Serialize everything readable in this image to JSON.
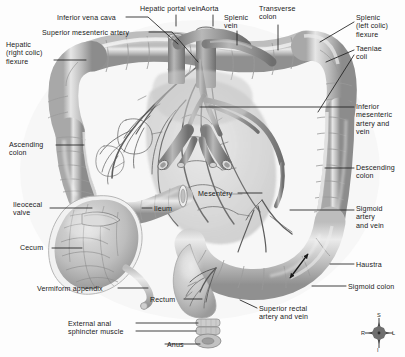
{
  "figure": {
    "background_color": "#fdfdfd",
    "tissue_color": "#d8d8d8",
    "vessel_color": "#8e8e8e",
    "leader_color": "#1f1f1f",
    "text_color": "#1a1a1a"
  },
  "labels": [
    {
      "id": "inferior-vena-cava",
      "text": "Inferior vena cava",
      "x": 57,
      "y": 14,
      "align": "l"
    },
    {
      "id": "hepatic-portal-vein",
      "text": "Hepatic portal vein",
      "x": 140,
      "y": 5,
      "align": "l"
    },
    {
      "id": "aorta",
      "text": "Aorta",
      "x": 201,
      "y": 5,
      "align": "l"
    },
    {
      "id": "splenic-vein",
      "text": "Splenic\nvein",
      "x": 224,
      "y": 14,
      "align": "l"
    },
    {
      "id": "transverse-colon",
      "text": "Transverse\ncolon",
      "x": 259,
      "y": 5,
      "align": "l"
    },
    {
      "id": "splenic-left-colic-flexure",
      "text": "Splenic\n(left colic)\nflexure",
      "x": 356,
      "y": 14,
      "align": "l"
    },
    {
      "id": "superior-mesenteric-artery",
      "text": "Superior mesenteric artery",
      "x": 42,
      "y": 29,
      "align": "l"
    },
    {
      "id": "hepatic-right-colic-flexure",
      "text": "Hepatic\n(right colic)\nflexure",
      "x": 6,
      "y": 41,
      "align": "l"
    },
    {
      "id": "taeniae-coli",
      "text": "Taeniae\ncoli",
      "x": 356,
      "y": 45,
      "align": "l"
    },
    {
      "id": "inferior-mesenteric-artery-and-vein",
      "text": "Inferior\nmesenteric\nartery and\nvein",
      "x": 356,
      "y": 103,
      "align": "l"
    },
    {
      "id": "ascending-colon",
      "text": "Ascending\ncolon",
      "x": 9,
      "y": 141,
      "align": "l"
    },
    {
      "id": "descending-colon",
      "text": "Descending\ncolon",
      "x": 356,
      "y": 164,
      "align": "l"
    },
    {
      "id": "mesentery",
      "text": "Mesentery",
      "x": 198,
      "y": 190,
      "align": "l"
    },
    {
      "id": "ileocecal-valve",
      "text": "Ileocecal\nvalve",
      "x": 13,
      "y": 201,
      "align": "l"
    },
    {
      "id": "ileum",
      "text": "Ileum",
      "x": 154,
      "y": 205,
      "align": "l"
    },
    {
      "id": "sigmoid-artery-and-vein",
      "text": "Sigmoid\nartery\nand vein",
      "x": 356,
      "y": 205,
      "align": "l"
    },
    {
      "id": "cecum",
      "text": "Cecum",
      "x": 20,
      "y": 244,
      "align": "l"
    },
    {
      "id": "haustra",
      "text": "Haustra",
      "x": 356,
      "y": 261,
      "align": "l"
    },
    {
      "id": "sigmoid-colon",
      "text": "Sigmoid colon",
      "x": 348,
      "y": 283,
      "align": "l"
    },
    {
      "id": "vermiform-appendix",
      "text": "Vermiform appendix",
      "x": 37,
      "y": 285,
      "align": "l"
    },
    {
      "id": "rectum",
      "text": "Rectum",
      "x": 150,
      "y": 296,
      "align": "l"
    },
    {
      "id": "superior-rectal-artery-and-vein",
      "text": "Superior rectal\nartery and vein",
      "x": 259,
      "y": 305,
      "align": "l"
    },
    {
      "id": "external-anal-sphincter-muscle",
      "text": "External anal\nsphincter muscle",
      "x": 68,
      "y": 320,
      "align": "l"
    },
    {
      "id": "anus",
      "text": "Anus",
      "x": 167,
      "y": 341,
      "align": "l"
    }
  ],
  "leaders": [
    {
      "id": "leader-inferior-vena-cava",
      "points": "126,17 148,17 178,44"
    },
    {
      "id": "leader-hepatic-portal-vein",
      "points": "176,15 176,26"
    },
    {
      "id": "leader-aorta",
      "points": "213,15 213,26"
    },
    {
      "id": "leader-splenic-vein",
      "points": "237,31 237,45"
    },
    {
      "id": "leader-transverse-colon",
      "points": "278,25 278,50"
    },
    {
      "id": "leader-splenic-flexure",
      "points": "354,22 320,42"
    },
    {
      "id": "leader-superior-mesenteric-artery",
      "points": "149,32 172,32 198,62"
    },
    {
      "id": "leader-hepatic-flexure",
      "points": "54,60 86,60"
    },
    {
      "id": "leader-taeniae-coli-a",
      "points": "354,50 326,62"
    },
    {
      "id": "leader-taeniae-coli-b",
      "points": "354,55 318,112"
    },
    {
      "id": "leader-inferior-mesenteric",
      "points": "354,107 200,107"
    },
    {
      "id": "leader-ascending-colon",
      "points": "56,145 84,145"
    },
    {
      "id": "leader-descending-colon",
      "points": "354,168 325,168"
    },
    {
      "id": "leader-mesentery",
      "points": "238,193 262,193"
    },
    {
      "id": "leader-ileocecal-valve",
      "points": "50,208 92,208"
    },
    {
      "id": "leader-ileum",
      "points": "152,208 142,208"
    },
    {
      "id": "leader-sigmoid-artery",
      "points": "354,210 290,210"
    },
    {
      "id": "leader-cecum",
      "points": "52,248 82,248"
    },
    {
      "id": "leader-haustra",
      "points": "354,264 330,264"
    },
    {
      "id": "leader-sigmoid-colon",
      "points": "346,286 312,286"
    },
    {
      "id": "leader-vermiform-appendix",
      "points": "118,288 148,288"
    },
    {
      "id": "leader-rectum",
      "points": "184,299 202,299"
    },
    {
      "id": "leader-superior-rectal",
      "points": "257,308 240,300"
    },
    {
      "id": "leader-external-anal-sphincter-a",
      "points": "136,323 198,323"
    },
    {
      "id": "leader-external-anal-sphincter-b",
      "points": "136,331 196,331"
    },
    {
      "id": "leader-anus",
      "points": "165,344 200,344"
    }
  ],
  "haustra_arrow": {
    "id": "haustra-double-arrow",
    "path": "M 306,256 L 290,276"
  },
  "compass": {
    "superior": "S",
    "inferior": "I",
    "right": "R",
    "left": "L"
  }
}
